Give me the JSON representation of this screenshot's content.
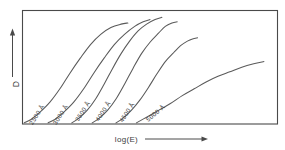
{
  "figure": {
    "background_color": "#ffffff",
    "line_color": "#5a5a5a",
    "frame_color": "#4a4a4a",
    "text_color": "#3d3d3d"
  },
  "axes": {
    "y_label": "D",
    "y_arrow": "up-arrow",
    "x_label": "log(E)",
    "x_arrow": "right-arrow"
  },
  "chart_data": {
    "type": "line",
    "title": "",
    "xlabel": "log(E)",
    "ylabel": "D",
    "grid": false,
    "legend_position": "inline-on-curve",
    "xlim": [
      0,
      100
    ],
    "ylim": [
      0,
      100
    ],
    "axis_ticks": [],
    "note": "Six photographic characteristic (H and D) curves, one per exposure wavelength, each sigmoid and shifted progressively to higher log(E) as wavelength increases.",
    "series": [
      {
        "name": "2500 Å",
        "label": "2500 Å",
        "label_rotation_deg": -57,
        "x": [
          1,
          5,
          10,
          16,
          22,
          28,
          34,
          40,
          46,
          52,
          58,
          62
        ],
        "y": [
          1,
          4,
          10,
          19,
          31,
          45,
          58,
          70,
          79,
          85,
          88,
          89
        ]
      },
      {
        "name": "3000 Å",
        "label": "3000 Å",
        "label_rotation_deg": -57,
        "x": [
          15,
          19,
          24,
          30,
          36,
          42,
          48,
          54,
          60,
          66,
          71,
          75
        ],
        "y": [
          1,
          4,
          10,
          19,
          31,
          45,
          58,
          70,
          79,
          86,
          90,
          92
        ]
      },
      {
        "name": "3500 Å",
        "label": "3500 Å",
        "label_rotation_deg": -57,
        "x": [
          29,
          33,
          38,
          43,
          48,
          53,
          58,
          63,
          68,
          73,
          78,
          82
        ],
        "y": [
          1,
          5,
          12,
          22,
          35,
          49,
          62,
          73,
          82,
          88,
          92,
          94
        ]
      },
      {
        "name": "4000 Å",
        "label": "4000 Å",
        "label_rotation_deg": -57,
        "x": [
          41,
          45,
          50,
          55,
          60,
          65,
          70,
          75,
          80,
          84,
          88,
          91
        ],
        "y": [
          1,
          5,
          12,
          22,
          35,
          49,
          62,
          72,
          80,
          86,
          89,
          90
        ]
      },
      {
        "name": "4500 Å",
        "label": "4500 Å",
        "label_rotation_deg": -57,
        "x": [
          55,
          59,
          64,
          69,
          74,
          79,
          84,
          89,
          93,
          97,
          100,
          103
        ],
        "y": [
          1,
          5,
          12,
          21,
          32,
          44,
          55,
          63,
          69,
          73,
          75,
          76
        ]
      },
      {
        "name": "5000 Å",
        "label": "5000 Å",
        "label_rotation_deg": -40,
        "x": [
          67,
          73,
          80,
          87,
          94,
          101,
          108,
          115,
          122,
          129,
          136,
          142
        ],
        "y": [
          1,
          6,
          12,
          18,
          25,
          31,
          37,
          42,
          46,
          50,
          53,
          55
        ]
      }
    ]
  }
}
